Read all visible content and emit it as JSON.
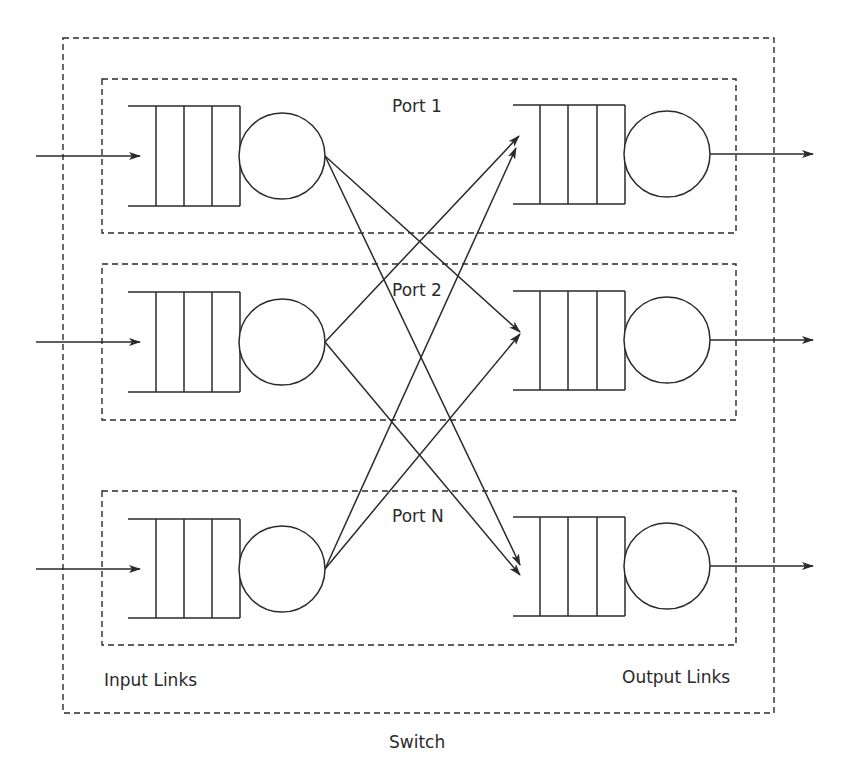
{
  "diagram": {
    "title": "Switch",
    "switch_label": "Switch",
    "input_links_label": "Input Links",
    "output_links_label": "Output Links",
    "stroke_color": "#2a2a2a",
    "background_color": "#ffffff",
    "ports": [
      {
        "label": "Port 1",
        "queue_slots": 4
      },
      {
        "label": "Port 2",
        "queue_slots": 4
      },
      {
        "label": "Port N",
        "queue_slots": 4
      }
    ],
    "connections": [
      {
        "from": "Port 1 input",
        "to": "Port 2 output"
      },
      {
        "from": "Port 1 input",
        "to": "Port N output"
      },
      {
        "from": "Port 2 input",
        "to": "Port 1 output"
      },
      {
        "from": "Port 2 input",
        "to": "Port N output"
      },
      {
        "from": "Port N input",
        "to": "Port 1 output"
      },
      {
        "from": "Port N input",
        "to": "Port 2 output"
      }
    ]
  }
}
